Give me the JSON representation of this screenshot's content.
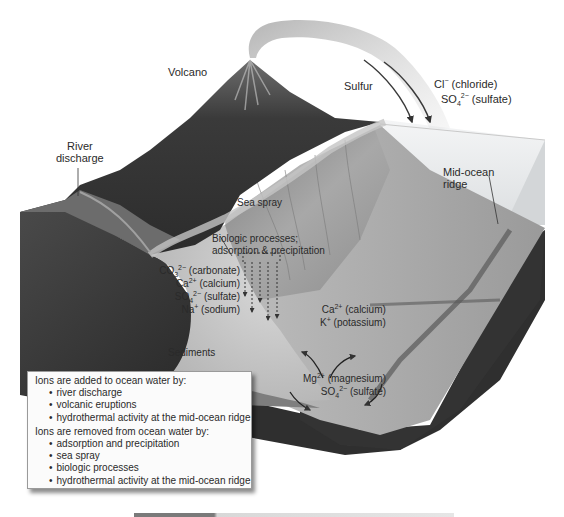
{
  "diagram": {
    "type": "block diagram",
    "labels": {
      "volcano": "Volcano",
      "sulfur": "Sulfur",
      "chloride": {
        "ion": "Cl",
        "charge": "−",
        "name": "(chloride)"
      },
      "sulfate_air": {
        "ion": "SO",
        "sub": "4",
        "charge": "2−",
        "name": "(sulfate)"
      },
      "river_discharge": [
        "River",
        "discharge"
      ],
      "mid_ocean_ridge": [
        "Mid-ocean",
        "ridge"
      ],
      "sea_spray": "Sea spray",
      "biologic": [
        "Biologic processes;",
        "adsorption & precipitation"
      ],
      "sediments": "Sediments",
      "removed_ions": [
        {
          "ion": "CO",
          "sub": "3",
          "charge": "2−",
          "name": "(carbonate)"
        },
        {
          "ion": "Ca",
          "sub": "",
          "charge": "2+",
          "name": "(calcium)"
        },
        {
          "ion": "SO",
          "sub": "4",
          "charge": "2−",
          "name": "(sulfate)"
        },
        {
          "ion": "Na",
          "sub": "",
          "charge": "+",
          "name": "(sodium)"
        }
      ],
      "vent_out_ions": [
        {
          "ion": "Ca",
          "sub": "",
          "charge": "2+",
          "name": "(calcium)"
        },
        {
          "ion": "K",
          "sub": "",
          "charge": "+",
          "name": "(potassium)"
        }
      ],
      "vent_in_ions": [
        {
          "ion": "Mg",
          "sub": "",
          "charge": "2+",
          "name": "(magnesium)"
        },
        {
          "ion": "SO",
          "sub": "4",
          "charge": "2−",
          "name": "(sulfate)"
        }
      ]
    },
    "legend": {
      "added_heading": "Ions are added to ocean water by:",
      "added": [
        "river discharge",
        "volcanic eruptions",
        "hydrothermal activity at the mid-ocean ridge"
      ],
      "removed_heading": "Ions are removed from ocean water by:",
      "removed": [
        "adsorption and precipitation",
        "sea spray",
        "biologic processes",
        "hydrothermal activity at the mid-ocean ridge"
      ]
    },
    "colors": {
      "land_dark": "#3d3d3d",
      "land_mid": "#6a6a6a",
      "seafloor": "#a9a9a9",
      "water_box": "#e9eaeb",
      "block_side": "#2e2e2e",
      "plume": "#9c9c9c"
    }
  }
}
